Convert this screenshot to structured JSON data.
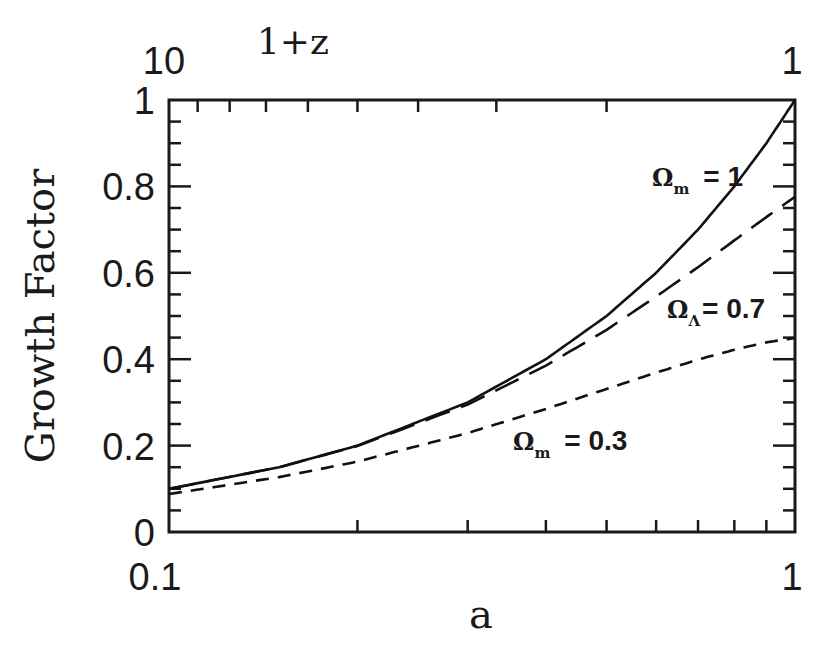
{
  "chart_data": {
    "type": "line",
    "title": "",
    "xlabel": "a",
    "ylabel": "Growth Factor",
    "top_xlabel": "1+z",
    "xscale": "log",
    "xlim": [
      0.1,
      1
    ],
    "ylim": [
      0,
      1
    ],
    "x_tick_labels": [
      "0.1",
      "1"
    ],
    "top_tick_labels": [
      "10",
      "1"
    ],
    "y_tick_labels": [
      "0",
      "0.2",
      "0.4",
      "0.6",
      "0.8",
      "1"
    ],
    "grid": false,
    "x": [
      0.1,
      0.15,
      0.2,
      0.3,
      0.4,
      0.5,
      0.6,
      0.7,
      0.8,
      0.9,
      1.0
    ],
    "series": [
      {
        "name": "Ωm = 1",
        "style": "solid",
        "values": [
          0.1,
          0.15,
          0.2,
          0.3,
          0.4,
          0.5,
          0.6,
          0.7,
          0.8,
          0.9,
          1.0
        ]
      },
      {
        "name": "ΩΛ = 0.7",
        "style": "long-dash",
        "values": [
          0.1,
          0.15,
          0.199,
          0.295,
          0.385,
          0.468,
          0.545,
          0.613,
          0.675,
          0.729,
          0.776
        ]
      },
      {
        "name": "Ωm = 0.3",
        "style": "short-dash",
        "values": [
          0.088,
          0.127,
          0.163,
          0.229,
          0.285,
          0.331,
          0.369,
          0.399,
          0.422,
          0.439,
          0.449
        ]
      }
    ],
    "annotations": [
      {
        "text_symbol": "Ω",
        "text_sub": "m",
        "text_rest": "=  1",
        "x_px": 652,
        "y_px": 186
      },
      {
        "text_symbol": "Ω",
        "text_sub": "Λ",
        "text_rest": "=  0.7",
        "x_px": 667,
        "y_px": 318
      },
      {
        "text_symbol": "Ω",
        "text_sub": "m",
        "text_rest": "=  0.3",
        "x_px": 513,
        "y_px": 450
      }
    ]
  }
}
